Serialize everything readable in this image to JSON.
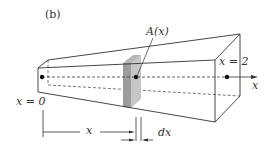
{
  "figure": {
    "panel_label": "(b)",
    "cross_section_label": "A(x)",
    "right_end_label": "x = 2",
    "axis_label": "x",
    "left_end_label": "x = 0",
    "distance_label": "x",
    "thickness_label": "dx"
  },
  "colors": {
    "line": "#333333",
    "slab_front": "#9a9a9a",
    "slab_side": "#c4c4c4",
    "background": "#ffffff"
  }
}
